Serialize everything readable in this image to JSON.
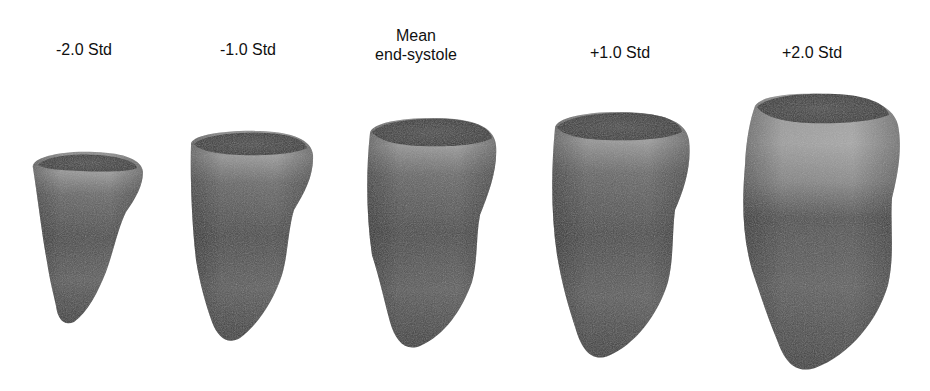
{
  "figure": {
    "title": "",
    "panels": [
      {
        "id": "minus2",
        "label_lines": [
          "-2.0 Std"
        ],
        "label_x": 84,
        "label_y": 40
      },
      {
        "id": "minus1",
        "label_lines": [
          "-1.0 Std"
        ],
        "label_x": 248,
        "label_y": 40
      },
      {
        "id": "mean",
        "label_lines": [
          "Mean",
          "end-systole"
        ],
        "label_x": 416,
        "label_y": 26
      },
      {
        "id": "plus1",
        "label_lines": [
          "+1.0 Std"
        ],
        "label_x": 620,
        "label_y": 43
      },
      {
        "id": "plus2",
        "label_lines": [
          "+2.0 Std"
        ],
        "label_x": 812,
        "label_y": 43
      }
    ]
  },
  "labels": {
    "minus2": "-2.0 Std",
    "minus1": "-1.0 Std",
    "mean_line1": "Mean",
    "mean_line2": "end-systole",
    "plus1": "+1.0 Std",
    "plus2": "+2.0 Std"
  },
  "colors": {
    "background": "#ffffff",
    "text": "#111111",
    "surface_dark": "#3a3a3a",
    "surface_mid": "#5c5c5c",
    "surface_light": "#9a9a9a",
    "cavity": "#3e3e3e"
  }
}
